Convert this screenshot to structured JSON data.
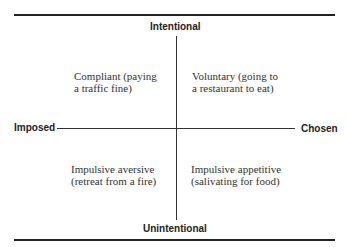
{
  "axes": {
    "top": "Intentional",
    "bottom": "Unintentional",
    "left": "Imposed",
    "right": "Chosen"
  },
  "quadrants": [
    {
      "position": "top-left",
      "line1": "Compliant (paying",
      "line2": "a traffic fine)"
    },
    {
      "position": "top-right",
      "line1": "Voluntary (going to",
      "line2": "a restaurant to eat)"
    },
    {
      "position": "bottom-left",
      "line1": "Impulsive aversive",
      "line2": "(retreat from a fire)"
    },
    {
      "position": "bottom-right",
      "line1": "Impulsive appetitive",
      "line2": "(salivating for food)"
    }
  ]
}
